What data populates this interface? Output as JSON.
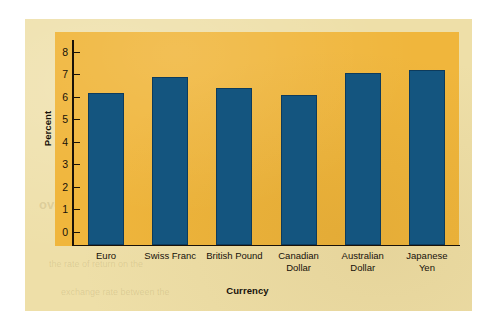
{
  "figure": {
    "background_color": "#eedfa8",
    "plot_background_color": "#f0b63c",
    "bar_color": "#14557f",
    "axis_color": "#1a1208"
  },
  "chart_data": {
    "type": "bar",
    "title": "",
    "xlabel": "Currency",
    "ylabel": "Percent",
    "categories": [
      "Euro",
      "Swiss Franc",
      "British Pound",
      "Canadian Dollar",
      "Australian Dollar",
      "Japanese Yen"
    ],
    "category_lines": [
      [
        "Euro"
      ],
      [
        "Swiss Franc"
      ],
      [
        "British Pound"
      ],
      [
        "Canadian",
        "Dollar"
      ],
      [
        "Australian",
        "Dollar"
      ],
      [
        "Japanese",
        "Yen"
      ]
    ],
    "values": [
      6.2,
      6.9,
      6.4,
      6.1,
      7.1,
      7.2
    ],
    "ylim": [
      0,
      8
    ],
    "yticks": [
      0,
      1,
      2,
      3,
      4,
      5,
      6,
      7,
      8
    ],
    "ytick_labels": [
      "0",
      "1",
      "2",
      "3",
      "4",
      "5",
      "6",
      "7",
      "8"
    ],
    "grid": false,
    "legend": false,
    "series": [
      {
        "name": "Percent",
        "values": [
          6.2,
          6.9,
          6.4,
          6.1,
          7.1,
          7.2
        ]
      }
    ]
  },
  "bleed_text": {
    "line_a": "nt of the second as of the first of",
    "line_b": "ence between the two rates",
    "line_c": "the rate of return on the",
    "line_d": "exchange rate between the",
    "line_e": "a forward contract to",
    "heading_a": "overing the Forward",
    "heading_b": "Covering the Forward Cover"
  }
}
